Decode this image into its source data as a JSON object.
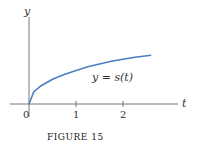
{
  "chart_data": {
    "type": "line",
    "title": "",
    "caption": "FIGURE 15",
    "xlabel": "t",
    "ylabel": "y",
    "curve_label": "y = s(t)",
    "x_ticks": [
      "0",
      "1",
      "2"
    ],
    "x_tick_values": [
      0,
      1,
      2
    ],
    "xlim": [
      -0.4,
      3.4
    ],
    "ylim": [
      -0.3,
      2.0
    ],
    "series": [
      {
        "name": "y = s(t)",
        "color": "#4a7fc4",
        "x": [
          0,
          0.1,
          0.25,
          0.5,
          0.75,
          1,
          1.25,
          1.5,
          1.75,
          2,
          2.25,
          2.6
        ],
        "y": [
          0,
          0.3,
          0.45,
          0.62,
          0.74,
          0.84,
          0.93,
          1.0,
          1.07,
          1.12,
          1.17,
          1.22
        ]
      }
    ],
    "grid": false
  },
  "caption": {
    "figure_word": "FIGURE",
    "figure_number": "15"
  }
}
